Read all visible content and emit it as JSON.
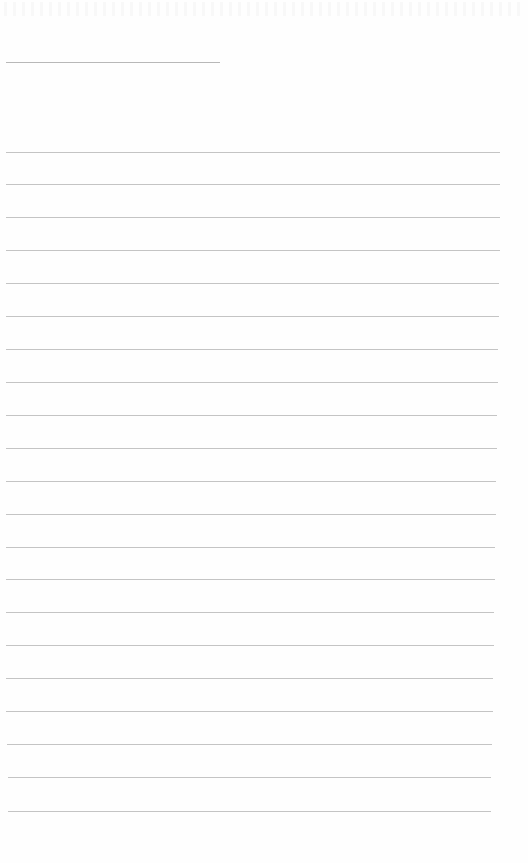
{
  "page": {
    "type": "blank ruled notebook page",
    "background_color": "#fefefe",
    "line_color": "#c4c4c4"
  },
  "title_line": {
    "x": 6,
    "y": 62,
    "width": 214
  },
  "ruled_lines": [
    {
      "y": 152,
      "x1": 6,
      "x2": 500
    },
    {
      "y": 184,
      "x1": 6,
      "x2": 500
    },
    {
      "y": 217,
      "x1": 6,
      "x2": 500
    },
    {
      "y": 250,
      "x1": 6,
      "x2": 500
    },
    {
      "y": 283,
      "x1": 6,
      "x2": 499
    },
    {
      "y": 316,
      "x1": 6,
      "x2": 499
    },
    {
      "y": 349,
      "x1": 6,
      "x2": 498
    },
    {
      "y": 382,
      "x1": 6,
      "x2": 498
    },
    {
      "y": 415,
      "x1": 6,
      "x2": 497
    },
    {
      "y": 448,
      "x1": 6,
      "x2": 497
    },
    {
      "y": 481,
      "x1": 6,
      "x2": 496
    },
    {
      "y": 514,
      "x1": 6,
      "x2": 496
    },
    {
      "y": 547,
      "x1": 6,
      "x2": 495
    },
    {
      "y": 579,
      "x1": 6,
      "x2": 495
    },
    {
      "y": 612,
      "x1": 6,
      "x2": 494
    },
    {
      "y": 645,
      "x1": 6,
      "x2": 494
    },
    {
      "y": 678,
      "x1": 6,
      "x2": 493
    },
    {
      "y": 711,
      "x1": 6,
      "x2": 493
    },
    {
      "y": 744,
      "x1": 7,
      "x2": 492
    },
    {
      "y": 777,
      "x1": 8,
      "x2": 491
    },
    {
      "y": 811,
      "x1": 8,
      "x2": 491
    }
  ]
}
